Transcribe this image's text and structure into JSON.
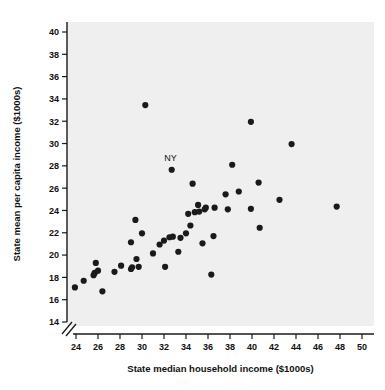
{
  "chart_data": {
    "type": "scatter",
    "title": "",
    "xlabel": "State median household income ($1000s)",
    "ylabel": "State mean per capita income ($1000s)",
    "xlim": [
      23,
      51
    ],
    "ylim": [
      14,
      41
    ],
    "xticks": [
      24,
      26,
      28,
      30,
      32,
      34,
      36,
      38,
      40,
      42,
      44,
      46,
      48,
      50
    ],
    "yticks": [
      14,
      16,
      18,
      20,
      22,
      24,
      26,
      28,
      30,
      32,
      34,
      36,
      38,
      40
    ],
    "xtick_labels": [
      "24",
      "26",
      "28",
      "30",
      "32",
      "34",
      "36",
      "38",
      "40",
      "42",
      "44",
      "46",
      "48",
      "50"
    ],
    "ytick_labels": [
      "14",
      "16",
      "18",
      "20",
      "22",
      "24",
      "26",
      "28",
      "30",
      "32",
      "34",
      "36",
      "38",
      "40"
    ],
    "grid": false,
    "legend": null,
    "y_axis_break": true,
    "y_axis_break_note": "axis break slashes below 14 near origin",
    "marker_color": "#1a1a1a",
    "plot_background": "#f0efef",
    "marker_size_px": 5,
    "annotations": [
      {
        "text": "NY",
        "x": 32.6,
        "y": 28.4,
        "point_x": 32.7,
        "point_y": 27.65
      }
    ],
    "points": [
      {
        "x": 23.9,
        "y": 17.1
      },
      {
        "x": 24.7,
        "y": 17.7
      },
      {
        "x": 25.6,
        "y": 18.2
      },
      {
        "x": 25.7,
        "y": 18.4
      },
      {
        "x": 25.8,
        "y": 19.3
      },
      {
        "x": 26.0,
        "y": 18.6
      },
      {
        "x": 26.4,
        "y": 16.75
      },
      {
        "x": 27.5,
        "y": 18.5
      },
      {
        "x": 28.1,
        "y": 19.05
      },
      {
        "x": 29.0,
        "y": 21.15
      },
      {
        "x": 29.0,
        "y": 18.75
      },
      {
        "x": 29.1,
        "y": 18.9
      },
      {
        "x": 29.4,
        "y": 23.15
      },
      {
        "x": 29.5,
        "y": 19.65
      },
      {
        "x": 29.7,
        "y": 18.95
      },
      {
        "x": 30.0,
        "y": 21.95
      },
      {
        "x": 30.3,
        "y": 33.45
      },
      {
        "x": 31.0,
        "y": 20.15
      },
      {
        "x": 31.6,
        "y": 20.95
      },
      {
        "x": 32.0,
        "y": 21.3
      },
      {
        "x": 32.1,
        "y": 18.95
      },
      {
        "x": 32.5,
        "y": 21.6
      },
      {
        "x": 32.7,
        "y": 27.65
      },
      {
        "x": 32.8,
        "y": 21.65
      },
      {
        "x": 33.3,
        "y": 20.3
      },
      {
        "x": 33.5,
        "y": 21.55
      },
      {
        "x": 34.0,
        "y": 21.95
      },
      {
        "x": 34.2,
        "y": 23.7
      },
      {
        "x": 34.4,
        "y": 22.65
      },
      {
        "x": 34.6,
        "y": 26.4
      },
      {
        "x": 34.8,
        "y": 23.85
      },
      {
        "x": 35.1,
        "y": 24.5
      },
      {
        "x": 35.2,
        "y": 23.9
      },
      {
        "x": 35.5,
        "y": 21.05
      },
      {
        "x": 35.7,
        "y": 24.1
      },
      {
        "x": 35.8,
        "y": 24.25
      },
      {
        "x": 36.3,
        "y": 18.25
      },
      {
        "x": 36.5,
        "y": 21.7
      },
      {
        "x": 36.6,
        "y": 24.25
      },
      {
        "x": 37.6,
        "y": 25.45
      },
      {
        "x": 37.8,
        "y": 24.1
      },
      {
        "x": 38.2,
        "y": 28.1
      },
      {
        "x": 38.8,
        "y": 25.7
      },
      {
        "x": 39.9,
        "y": 31.95
      },
      {
        "x": 39.9,
        "y": 24.15
      },
      {
        "x": 40.6,
        "y": 26.5
      },
      {
        "x": 40.7,
        "y": 22.45
      },
      {
        "x": 42.5,
        "y": 24.95
      },
      {
        "x": 43.6,
        "y": 29.95
      },
      {
        "x": 47.7,
        "y": 24.35
      }
    ]
  }
}
